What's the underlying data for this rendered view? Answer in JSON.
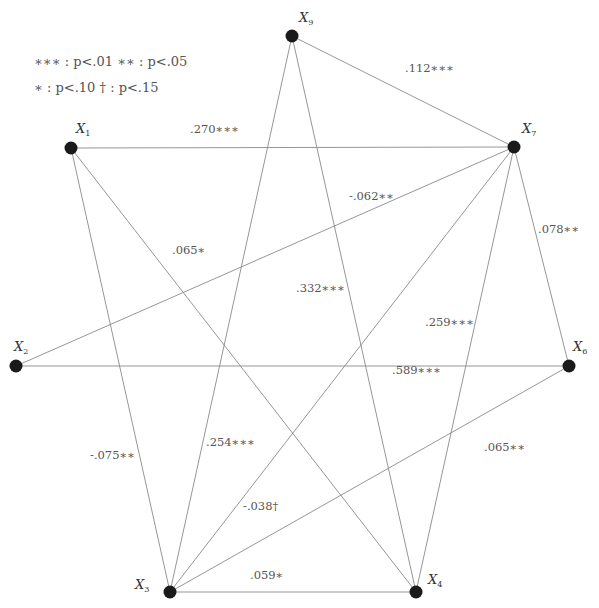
{
  "legend": {
    "lines": [
      [
        {
          "stars": "∗∗∗",
          "sep": ":",
          "p": "p",
          "cmp": "<.01"
        },
        {
          "stars": "∗∗",
          "sep": ":",
          "p": "p",
          "cmp": "<.05"
        }
      ],
      [
        {
          "stars": "∗",
          "sep": ":",
          "p": "p",
          "cmp": "<.10"
        },
        {
          "stars": "†",
          "sep": ":",
          "p": "p",
          "cmp": "<.15"
        }
      ]
    ],
    "line1_text": "∗∗∗ : p<.01   ∗∗ : p<.05",
    "line2_text": "∗ : p<.10   † : p<.15"
  },
  "nodes": [
    {
      "id": "X9",
      "letter": "X",
      "sub": "9",
      "x": 292,
      "y": 36,
      "lx": 299,
      "ly": 22
    },
    {
      "id": "X1",
      "letter": "X",
      "sub": "1",
      "x": 71,
      "y": 148,
      "lx": 76,
      "ly": 133
    },
    {
      "id": "X7",
      "letter": "X",
      "sub": "7",
      "x": 514,
      "y": 147,
      "lx": 522,
      "ly": 133
    },
    {
      "id": "X2",
      "letter": "X",
      "sub": "2",
      "x": 16,
      "y": 366,
      "lx": 14,
      "ly": 351
    },
    {
      "id": "X6",
      "letter": "X",
      "sub": "6",
      "x": 569,
      "y": 366,
      "lx": 573,
      "ly": 351
    },
    {
      "id": "X3",
      "letter": "X",
      "sub": "3",
      "x": 170,
      "y": 592,
      "lx": 135,
      "ly": 589
    },
    {
      "id": "X4",
      "letter": "X",
      "sub": "4",
      "x": 416,
      "y": 592,
      "lx": 428,
      "ly": 584
    }
  ],
  "edges": [
    {
      "from": "X9",
      "to": "X7",
      "label": ".112∗∗∗",
      "lx": 405,
      "ly": 72
    },
    {
      "from": "X1",
      "to": "X7",
      "label": ".270∗∗∗",
      "lx": 190,
      "ly": 133
    },
    {
      "from": "X7",
      "to": "X2",
      "label": "-.062∗∗",
      "lx": 349,
      "ly": 200
    },
    {
      "from": "X7",
      "to": "X6",
      "label": ".078∗∗",
      "lx": 538,
      "ly": 233
    },
    {
      "from": "X1",
      "to": "X4",
      "label": ".065∗",
      "lx": 172,
      "ly": 254
    },
    {
      "from": "X9",
      "to": "X4",
      "label": ".332∗∗∗",
      "lx": 296,
      "ly": 292
    },
    {
      "from": "X7",
      "to": "X4",
      "label": ".259∗∗∗",
      "lx": 425,
      "ly": 326
    },
    {
      "from": "X2",
      "to": "X6",
      "label": ".589∗∗∗",
      "lx": 392,
      "ly": 374
    },
    {
      "from": "X1",
      "to": "X3",
      "label": "-.075∗∗",
      "lx": 90,
      "ly": 459
    },
    {
      "from": "X9",
      "to": "X3",
      "label": ".254∗∗∗",
      "lx": 206,
      "ly": 446
    },
    {
      "from": "X7",
      "to": "X3",
      "label": "-.038†",
      "lx": 243,
      "ly": 510
    },
    {
      "from": "X6",
      "to": "X3",
      "label": ".065∗∗",
      "lx": 484,
      "ly": 451
    },
    {
      "from": "X3",
      "to": "X4",
      "label": ".059∗",
      "lx": 250,
      "ly": 579
    }
  ],
  "colors": {
    "edge": "#8a8a8a",
    "node": "#1a1a1a",
    "text": "#555555",
    "background": "#ffffff"
  }
}
